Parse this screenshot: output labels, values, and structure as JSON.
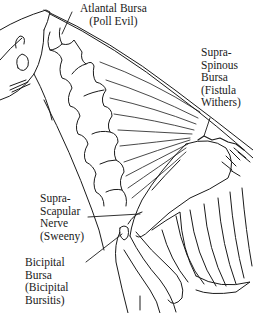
{
  "diagram": {
    "colors": {
      "line": "#1a1a1a",
      "background": "#ffffff"
    },
    "labels": [
      {
        "id": "atlantal",
        "lines": [
          "Atlantal Bursa",
          "(Poll Evil)"
        ]
      },
      {
        "id": "supraspinous",
        "lines": [
          "Supra-",
          "Spinous",
          "Bursa",
          "(Fistula",
          "Withers)"
        ]
      },
      {
        "id": "suprascapular",
        "lines": [
          "Supra-",
          "Scapular",
          "Nerve",
          "(Sweeny)"
        ]
      },
      {
        "id": "bicipital",
        "lines": [
          "Bicipital",
          "Bursa",
          "(Bicipital",
          "Bursitis)"
        ]
      }
    ]
  }
}
